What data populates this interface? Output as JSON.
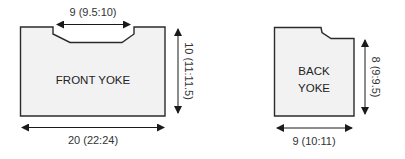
{
  "colors": {
    "piece_fill": "#f2f2f2",
    "outline": "#2b2b2b",
    "arrow": "#1a1a1a",
    "text": "#333333"
  },
  "front_yoke": {
    "label": "FRONT YOKE",
    "neck_width": "9 (9.5:10)",
    "height": "10 (11:11.5)",
    "width": "20 (22:24)"
  },
  "back_yoke": {
    "label_line1": "BACK",
    "label_line2": "YOKE",
    "height": "8 (9:9.5)",
    "width": "9 (10:11)"
  }
}
